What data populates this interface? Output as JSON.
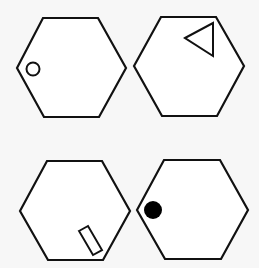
{
  "colors": {
    "background": "#f7f7f7",
    "stroke": "#111111",
    "fill": "#000000"
  },
  "panels": [
    {
      "id": "top-left",
      "shape": "hexagon",
      "mark": {
        "type": "circle",
        "filled": false,
        "position": "inside left vertex"
      }
    },
    {
      "id": "top-right",
      "shape": "hexagon",
      "mark": {
        "type": "triangle",
        "filled": false,
        "position": "inside top-right vertex"
      }
    },
    {
      "id": "bottom-left",
      "shape": "hexagon",
      "mark": {
        "type": "rectangle",
        "filled": false,
        "position": "inside bottom-right vertex"
      }
    },
    {
      "id": "bottom-right",
      "shape": "hexagon",
      "mark": {
        "type": "circle",
        "filled": true,
        "position": "inside left vertex"
      }
    }
  ]
}
